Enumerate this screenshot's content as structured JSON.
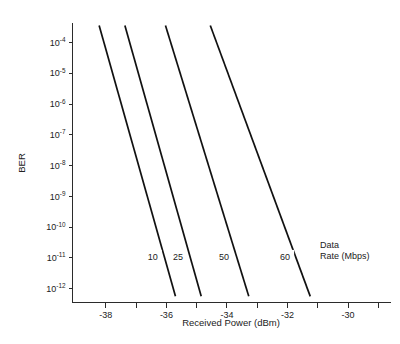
{
  "chart_data": {
    "type": "line",
    "title": "",
    "xlabel": "Received Power (dBm)",
    "ylabel": "BER",
    "xlim": [
      -39.1,
      -28.6
    ],
    "ylim": [
      -12.45,
      -3.35
    ],
    "yscale": "log",
    "grid": false,
    "legend_position": "inside-right",
    "legend_title_line1": "Data",
    "legend_title_line2": "Rate (Mbps)",
    "xticks": [
      -38,
      -36,
      -34,
      -32,
      -30
    ],
    "xtick_labels": [
      "-38",
      "-36",
      "-34",
      "-32",
      "-30"
    ],
    "xticks_minor": [
      -37,
      -35,
      -33,
      -31,
      -29
    ],
    "yticks_exponents": [
      -4,
      -5,
      -6,
      -7,
      -8,
      -9,
      -10,
      -11,
      -12
    ],
    "ytick_labels": [
      {
        "base": "10",
        "exp": "-4"
      },
      {
        "base": "10",
        "exp": "-5"
      },
      {
        "base": "10",
        "exp": "-6"
      },
      {
        "base": "10",
        "exp": "-7"
      },
      {
        "base": "10",
        "exp": "-8"
      },
      {
        "base": "10",
        "exp": "-9"
      },
      {
        "base": "10",
        "exp": "-10"
      },
      {
        "base": "10",
        "exp": "-11"
      },
      {
        "base": "10",
        "exp": "-12"
      }
    ],
    "line_color": "#111111",
    "axis_color": "#2b2b2b",
    "series": [
      {
        "name": "10",
        "label": "10",
        "label_x": -36.45,
        "label_y_exp": -11.0,
        "points": [
          {
            "x": -38.22,
            "y_exp": -3.45
          },
          {
            "x": -35.7,
            "y_exp": -12.25
          }
        ]
      },
      {
        "name": "25",
        "label": "25",
        "label_x": -35.62,
        "label_y_exp": -11.0,
        "points": [
          {
            "x": -37.37,
            "y_exp": -3.45
          },
          {
            "x": -34.85,
            "y_exp": -12.25
          }
        ]
      },
      {
        "name": "50",
        "label": "50",
        "label_x": -34.1,
        "label_y_exp": -11.0,
        "points": [
          {
            "x": -36.03,
            "y_exp": -3.45
          },
          {
            "x": -33.28,
            "y_exp": -12.25
          }
        ]
      },
      {
        "name": "60",
        "label": "60",
        "label_x": -32.08,
        "label_y_exp": -11.0,
        "points": [
          {
            "x": -34.55,
            "y_exp": -3.45
          },
          {
            "x": -31.25,
            "y_exp": -12.25
          }
        ]
      }
    ]
  }
}
